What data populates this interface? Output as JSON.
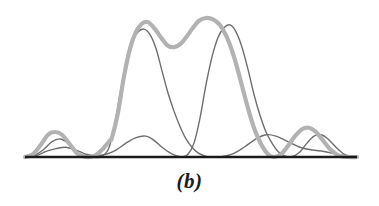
{
  "figure": {
    "caption": "(b)",
    "background_color": "#ffffff",
    "baseline_color": "#1a1a1a",
    "envelope_color": "#b2b2b2",
    "element_curve_color": "#6e6e6e",
    "sidelobe_color": "#8f8f8f"
  },
  "chart_data": {
    "type": "line",
    "title": "",
    "subtitle": "",
    "xlabel": "",
    "ylabel": "",
    "caption": "(b)",
    "grid": false,
    "legend": "none",
    "axis": {
      "baseline_y_px": 157,
      "baseline_x_start_px": 25,
      "baseline_x_end_px": 357,
      "xlim": [
        25,
        357
      ],
      "ylim": [
        0,
        1.0
      ],
      "x_tick_labels": [],
      "y_tick_labels": [],
      "axes_visible": [
        "bottom"
      ]
    },
    "series": [
      {
        "name": "array-pattern-envelope",
        "role": "total-pattern",
        "color": "#b2b2b2",
        "stroke_width": 4.2,
        "points": [
          [
            25,
            0.0
          ],
          [
            33,
            0.02
          ],
          [
            41,
            0.09
          ],
          [
            48,
            0.16
          ],
          [
            55,
            0.18
          ],
          [
            62,
            0.16
          ],
          [
            70,
            0.09
          ],
          [
            78,
            0.02
          ],
          [
            86,
            0.0
          ],
          [
            95,
            0.01
          ],
          [
            103,
            0.06
          ],
          [
            110,
            0.12
          ],
          [
            112,
            0.14
          ],
          [
            118,
            0.32
          ],
          [
            124,
            0.58
          ],
          [
            130,
            0.78
          ],
          [
            136,
            0.9
          ],
          [
            142,
            0.96
          ],
          [
            148,
            0.97
          ],
          [
            155,
            0.92
          ],
          [
            162,
            0.85
          ],
          [
            168,
            0.8
          ],
          [
            174,
            0.79
          ],
          [
            180,
            0.81
          ],
          [
            186,
            0.86
          ],
          [
            193,
            0.93
          ],
          [
            199,
            0.98
          ],
          [
            206,
            1.0
          ],
          [
            213,
            0.99
          ],
          [
            220,
            0.95
          ],
          [
            227,
            0.86
          ],
          [
            234,
            0.72
          ],
          [
            241,
            0.54
          ],
          [
            248,
            0.35
          ],
          [
            255,
            0.19
          ],
          [
            262,
            0.08
          ],
          [
            268,
            0.02
          ],
          [
            274,
            0.0
          ],
          [
            281,
            0.02
          ],
          [
            288,
            0.08
          ],
          [
            295,
            0.15
          ],
          [
            302,
            0.2
          ],
          [
            309,
            0.21
          ],
          [
            316,
            0.18
          ],
          [
            323,
            0.12
          ],
          [
            331,
            0.05
          ],
          [
            339,
            0.01
          ],
          [
            348,
            0.0
          ],
          [
            357,
            0.0
          ]
        ]
      },
      {
        "name": "element-pattern-left",
        "role": "individual-element",
        "color": "#6e6e6e",
        "stroke_width": 1.4,
        "points": [
          [
            25,
            0.0
          ],
          [
            34,
            0.01
          ],
          [
            43,
            0.05
          ],
          [
            52,
            0.11
          ],
          [
            60,
            0.13
          ],
          [
            68,
            0.1
          ],
          [
            76,
            0.04
          ],
          [
            84,
            0.01
          ],
          [
            92,
            0.0
          ],
          [
            100,
            0.0
          ],
          [
            108,
            0.05
          ],
          [
            114,
            0.2
          ],
          [
            120,
            0.45
          ],
          [
            126,
            0.68
          ],
          [
            132,
            0.83
          ],
          [
            138,
            0.9
          ],
          [
            144,
            0.92
          ],
          [
            150,
            0.88
          ],
          [
            156,
            0.78
          ],
          [
            162,
            0.62
          ],
          [
            168,
            0.46
          ],
          [
            174,
            0.33
          ],
          [
            180,
            0.22
          ],
          [
            186,
            0.13
          ],
          [
            192,
            0.07
          ],
          [
            198,
            0.03
          ],
          [
            204,
            0.01
          ],
          [
            210,
            0.0
          ],
          [
            220,
            0.0
          ],
          [
            232,
            0.02
          ],
          [
            244,
            0.07
          ],
          [
            256,
            0.13
          ],
          [
            266,
            0.16
          ],
          [
            276,
            0.15
          ],
          [
            288,
            0.11
          ],
          [
            300,
            0.07
          ],
          [
            312,
            0.05
          ],
          [
            324,
            0.04
          ],
          [
            336,
            0.02
          ],
          [
            346,
            0.01
          ],
          [
            357,
            0.0
          ]
        ]
      },
      {
        "name": "element-pattern-right",
        "role": "individual-element",
        "color": "#6e6e6e",
        "stroke_width": 1.4,
        "points": [
          [
            25,
            0.0
          ],
          [
            36,
            0.01
          ],
          [
            46,
            0.04
          ],
          [
            56,
            0.06
          ],
          [
            66,
            0.07
          ],
          [
            76,
            0.05
          ],
          [
            86,
            0.02
          ],
          [
            96,
            0.01
          ],
          [
            106,
            0.02
          ],
          [
            116,
            0.05
          ],
          [
            126,
            0.1
          ],
          [
            136,
            0.14
          ],
          [
            146,
            0.15
          ],
          [
            154,
            0.12
          ],
          [
            162,
            0.07
          ],
          [
            170,
            0.03
          ],
          [
            176,
            0.01
          ],
          [
            182,
            0.0
          ],
          [
            188,
            0.02
          ],
          [
            194,
            0.1
          ],
          [
            200,
            0.28
          ],
          [
            206,
            0.52
          ],
          [
            212,
            0.72
          ],
          [
            218,
            0.86
          ],
          [
            224,
            0.93
          ],
          [
            230,
            0.95
          ],
          [
            236,
            0.9
          ],
          [
            242,
            0.79
          ],
          [
            248,
            0.63
          ],
          [
            254,
            0.45
          ],
          [
            260,
            0.3
          ],
          [
            266,
            0.18
          ],
          [
            272,
            0.1
          ],
          [
            278,
            0.04
          ],
          [
            284,
            0.01
          ],
          [
            291,
            0.0
          ],
          [
            299,
            0.03
          ],
          [
            307,
            0.1
          ],
          [
            314,
            0.15
          ],
          [
            321,
            0.16
          ],
          [
            328,
            0.13
          ],
          [
            336,
            0.07
          ],
          [
            344,
            0.02
          ],
          [
            352,
            0.0
          ],
          [
            357,
            0.0
          ]
        ]
      }
    ],
    "annotations": [
      {
        "name": "main-lobe-left",
        "text": "",
        "x_px": 146,
        "peak_value": 0.97
      },
      {
        "name": "main-lobe-right",
        "text": "",
        "x_px": 207,
        "peak_value": 1.0
      },
      {
        "name": "central-dip",
        "text": "",
        "x_px": 175,
        "value": 0.79
      }
    ]
  }
}
